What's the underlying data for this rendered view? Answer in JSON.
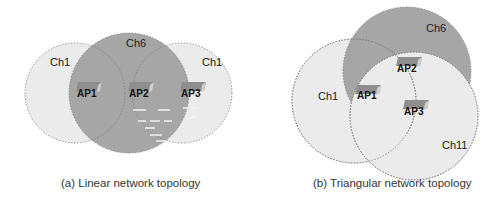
{
  "colors": {
    "light_fill": "#ebebeb",
    "dark_fill": "#a6a6a6",
    "stroke": "#808080",
    "ap_box": "#8e8e8e",
    "ap_box_light": "#cfcfcf"
  },
  "linear": {
    "caption": "(a) Linear network topology",
    "cells": [
      {
        "label": "Ch1",
        "cx": 75,
        "cy": 93,
        "r": 50,
        "shade": "light"
      },
      {
        "label": "Ch6",
        "cx": 129,
        "cy": 93,
        "r": 60,
        "shade": "dark"
      },
      {
        "label": "Ch1",
        "cx": 182,
        "cy": 93,
        "r": 50,
        "shade": "light"
      }
    ],
    "channel_labels": [
      {
        "text": "Ch1",
        "x": 50,
        "y": 66
      },
      {
        "text": "Ch6",
        "x": 126,
        "y": 47
      },
      {
        "text": "Ch1",
        "x": 202,
        "y": 66
      }
    ],
    "aps": [
      {
        "label": "AP1",
        "x": 76,
        "y": 93
      },
      {
        "label": "AP2",
        "x": 128,
        "y": 93
      },
      {
        "label": "AP3",
        "x": 180,
        "y": 93
      }
    ]
  },
  "triangular": {
    "caption": "(b) Triangular network topology",
    "cells": [
      {
        "label": "Ch1",
        "cx": 354,
        "cy": 101,
        "r": 62,
        "shade": "light"
      },
      {
        "label": "Ch6",
        "cx": 407,
        "cy": 71,
        "r": 64,
        "shade": "dark"
      },
      {
        "label": "Ch11",
        "cx": 414,
        "cy": 116,
        "r": 64,
        "shade": "light"
      }
    ],
    "channel_labels": [
      {
        "text": "Ch6",
        "x": 426,
        "y": 32
      },
      {
        "text": "Ch1",
        "x": 318,
        "y": 100
      },
      {
        "text": "Ch11",
        "x": 442,
        "y": 149
      }
    ],
    "aps": [
      {
        "label": "AP2",
        "x": 405,
        "y": 67
      },
      {
        "label": "AP1",
        "x": 371,
        "y": 95
      },
      {
        "label": "AP3",
        "x": 413,
        "y": 110
      }
    ]
  }
}
